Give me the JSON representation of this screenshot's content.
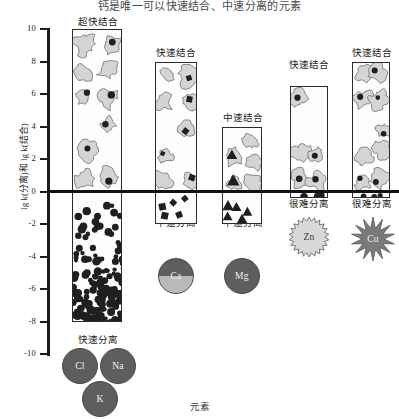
{
  "chart_data": {
    "type": "bar",
    "title": "钙是唯一可以快速结合、中速分离的元素",
    "xlabel": "元素",
    "ylabel": "lg k(分离)和 lg k(结合)",
    "ylim": [
      -10,
      10
    ],
    "yticks": [
      10,
      8,
      6,
      4,
      2,
      0,
      -2,
      -4,
      -6,
      -8,
      -10
    ],
    "grid": false,
    "legend": "none",
    "categories": [
      "Cl, Na, K",
      "Ca",
      "Mg",
      "Zn",
      "Cu"
    ],
    "series": [
      {
        "name": "lg k(结合)",
        "values": [
          10.0,
          8.0,
          4.0,
          6.5,
          8.0
        ]
      },
      {
        "name": "lg k(分离)",
        "values": [
          -8.0,
          -2.0,
          -2.0,
          -0.4,
          -0.4
        ]
      }
    ],
    "annotations": {
      "binding_labels": [
        "超快结合",
        "快速结合",
        "中速结合",
        "快速结合",
        "快速结合"
      ],
      "separation_labels": [
        "快速分离",
        "中速分离",
        "中速分离",
        "很难分离",
        "很难分离"
      ]
    }
  },
  "bars": [
    {
      "id": "bar-clnak",
      "binding_label": "超快结合",
      "separation_label": "快速分离",
      "top_value": 10.0,
      "bottom_value": -8.0,
      "elements": [
        "Cl",
        "Na",
        "K"
      ]
    },
    {
      "id": "bar-ca",
      "binding_label": "快速结合",
      "separation_label": "中速分离",
      "top_value": 8.0,
      "bottom_value": -2.0,
      "elements": [
        "Ca"
      ]
    },
    {
      "id": "bar-mg",
      "binding_label": "中速结合",
      "separation_label": "中速分离",
      "top_value": 4.0,
      "bottom_value": -2.0,
      "elements": [
        "Mg"
      ]
    },
    {
      "id": "bar-zn",
      "binding_label": "快速结合",
      "separation_label": "很难分离",
      "top_value": 6.5,
      "bottom_value": -0.4,
      "elements": [
        "Zn"
      ]
    },
    {
      "id": "bar-cu",
      "binding_label": "快速结合",
      "separation_label": "很难分离",
      "top_value": 8.0,
      "bottom_value": -0.4,
      "elements": [
        "Cu"
      ]
    }
  ],
  "axis": {
    "y_title": "lg k(分离)和 lg k(结合)",
    "x_title": "元素",
    "ticks": [
      "10",
      "8",
      "6",
      "4",
      "2",
      "0",
      "-2",
      "-4",
      "-6",
      "-8",
      "-10"
    ]
  },
  "colors": {
    "axis": "#1b1b1b",
    "zero_line": "#111111",
    "bar_fill": "#fdfdfd",
    "bar_stroke": "#2b2b2b",
    "blob_fill": "#d4d4d4",
    "dot_fill": "#1f1f1f",
    "element_dark": "#5e5e5e",
    "element_light": "#b9b9b9",
    "star_zn": "#d8d8d8",
    "star_cu": "#7a7a7a"
  }
}
